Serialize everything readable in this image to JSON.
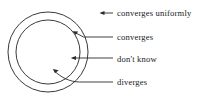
{
  "figure": {
    "kind": "concentric-circles-convergence-diagram",
    "background_color": "#ffffff",
    "stroke_color": "#333333",
    "text_color": "#1a1a1a",
    "canvas": {
      "width": 214,
      "height": 99
    },
    "circles": [
      {
        "name": "outer-circle",
        "cx": 48,
        "cy": 52,
        "r": 40,
        "stroke_width": 1
      },
      {
        "name": "inner-circle",
        "cx": 48,
        "cy": 52,
        "r": 32,
        "stroke_width": 1
      }
    ],
    "annotations": [
      {
        "id": "converges-uniformly",
        "label": "converges uniformly",
        "region": "outside both circles",
        "leader": {
          "type": "straight",
          "from_x": 113,
          "from_y": 13,
          "to_x": 100,
          "to_y": 13
        },
        "arrow_tip": {
          "x": 100,
          "y": 13
        }
      },
      {
        "id": "converges",
        "label": "converges",
        "region": "annulus between circles",
        "leader": {
          "type": "elbow",
          "from_x": 113,
          "from_y": 37,
          "mid_x": 82,
          "mid_y": 37,
          "to_x": 72,
          "to_y": 31
        },
        "arrow_tip": {
          "x": 72,
          "y": 31
        }
      },
      {
        "id": "dont-know",
        "label": "don't know",
        "region": "inner circle boundary",
        "leader": {
          "type": "straight",
          "from_x": 113,
          "from_y": 58,
          "to_x": 71,
          "to_y": 58
        },
        "arrow_tip": {
          "x": 71,
          "y": 58
        }
      },
      {
        "id": "diverges",
        "label": "diverges",
        "region": "inner disc",
        "leader": {
          "type": "curved",
          "from_x": 113,
          "from_y": 82,
          "mid_x": 78,
          "mid_y": 82,
          "to_x": 52,
          "to_y": 69
        },
        "arrow_tip": {
          "x": 52,
          "y": 69
        }
      }
    ]
  }
}
